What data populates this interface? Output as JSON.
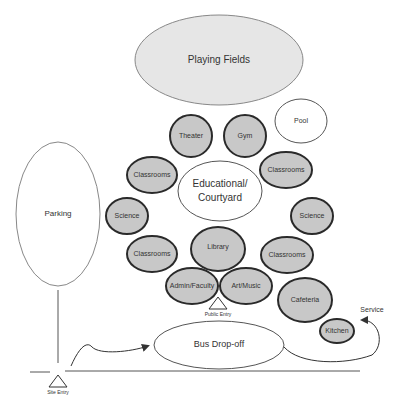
{
  "diagram": {
    "spaces": {
      "playing_fields": "Playing Fields",
      "pool": "Pool",
      "theater": "Theater",
      "gym": "Gym",
      "classrooms_nw": "Classrooms",
      "classrooms_ne": "Classrooms",
      "courtyard_line1": "Educational/",
      "courtyard_line2": "Courtyard",
      "science_w": "Science",
      "science_e": "Science",
      "library": "Library",
      "classrooms_sw": "Classrooms",
      "classrooms_se": "Classrooms",
      "admin": "Admin/Faculty",
      "art": "Art/Music",
      "cafeteria": "Cafeteria",
      "kitchen": "Kitchen",
      "parking": "Parking",
      "bus": "Bus Drop-off"
    },
    "labels": {
      "public_entry": "Public Entry",
      "site_entry": "Site Entry",
      "service": "Service"
    },
    "colors": {
      "grey_fill": "#c8c8c8",
      "light_fill": "#e6e6e6",
      "stroke_dark": "#2a2a2a",
      "stroke_light": "#888888"
    }
  }
}
